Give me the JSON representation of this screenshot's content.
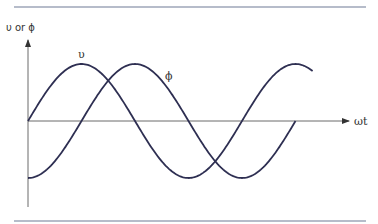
{
  "chart_data": {
    "type": "line",
    "title": "",
    "xlabel": "ωt",
    "ylabel": "υ or ϕ",
    "grid": false,
    "xlim_periods": [
      0,
      1.33
    ],
    "ylim": [
      -1.2,
      1.2
    ],
    "series": [
      {
        "name": "υ",
        "label": "υ",
        "function": "sin(ωt)",
        "phase_deg": 0,
        "amplitude": 1,
        "start_periods": 0,
        "end_periods": 1.33,
        "color": "#2e2f52"
      },
      {
        "name": "ϕ",
        "label": "ϕ",
        "function": "-cos(ωt)",
        "phase_deg": -90,
        "amplitude": 1,
        "start_periods": 0,
        "end_periods": 1.25,
        "color": "#2e2f52"
      }
    ]
  }
}
